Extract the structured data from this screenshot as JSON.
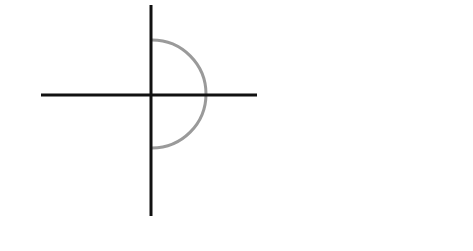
{
  "diagram": {
    "background": "#ffffff",
    "axes": {
      "color": "#111111",
      "width": 3,
      "horizontal": {
        "x1": 41,
        "y1": 95,
        "x2": 257,
        "y2": 95
      },
      "vertical": {
        "x1": 151,
        "y1": 5,
        "x2": 151,
        "y2": 216
      }
    },
    "semicircle": {
      "color": "#9a9a9a",
      "width": 3,
      "center": [
        152,
        94
      ],
      "radius": 54,
      "side": "right"
    }
  }
}
